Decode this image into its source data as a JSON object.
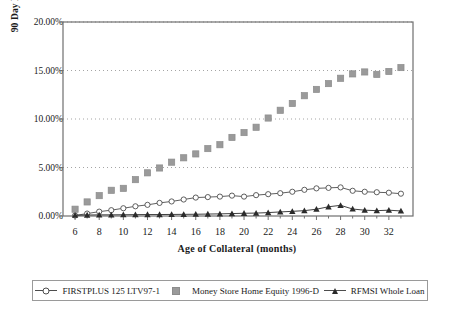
{
  "chart_data": {
    "type": "line",
    "title": "",
    "xlabel": "Age of Collateral (months)",
    "ylabel": "90 Day Delinquency",
    "ylabel_superscript": "1",
    "xlim": [
      5,
      34
    ],
    "ylim": [
      0,
      20
    ],
    "ytick_labels": [
      "0.00%",
      "5.00%",
      "10.00%",
      "15.00%",
      "20.00%"
    ],
    "ytick_values": [
      0,
      5,
      10,
      15,
      20
    ],
    "xtick_labels": [
      "6",
      "8",
      "10",
      "12",
      "14",
      "16",
      "18",
      "20",
      "22",
      "24",
      "26",
      "28",
      "30",
      "32"
    ],
    "xtick_values": [
      6,
      8,
      10,
      12,
      14,
      16,
      18,
      20,
      22,
      24,
      26,
      28,
      30,
      32
    ],
    "grid": "horizontal-dotted",
    "legend_position": "bottom",
    "x": [
      6,
      7,
      8,
      9,
      10,
      11,
      12,
      13,
      14,
      15,
      16,
      17,
      18,
      19,
      20,
      21,
      22,
      23,
      24,
      25,
      26,
      27,
      28,
      29,
      30,
      31,
      32,
      33
    ],
    "series": [
      {
        "name": "FIRSTPLUS 125 LTV97-1",
        "marker": "open-circle",
        "line": true,
        "color": "#4d4d4d",
        "values": [
          0.05,
          0.25,
          0.45,
          0.6,
          0.8,
          1.0,
          1.15,
          1.35,
          1.5,
          1.7,
          1.9,
          1.95,
          2.0,
          2.1,
          2.0,
          2.15,
          2.25,
          2.35,
          2.5,
          2.7,
          2.85,
          2.9,
          2.95,
          2.6,
          2.5,
          2.45,
          2.4,
          2.3
        ]
      },
      {
        "name": "Money Store Home Equity 1996-D",
        "marker": "filled-square",
        "line": false,
        "color": "#9a9a9a",
        "values": [
          0.7,
          1.45,
          2.1,
          2.65,
          2.85,
          3.75,
          4.45,
          4.95,
          5.55,
          6.0,
          6.4,
          6.95,
          7.35,
          8.1,
          8.6,
          9.15,
          10.1,
          10.9,
          11.6,
          12.4,
          13.05,
          13.65,
          14.2,
          14.65,
          14.85,
          14.6,
          14.9,
          15.3
        ]
      },
      {
        "name": "RFMSI Whole Loan",
        "marker": "filled-triangle",
        "line": true,
        "color": "#2b2b2b",
        "values": [
          0.08,
          0.1,
          0.12,
          0.12,
          0.13,
          0.14,
          0.15,
          0.15,
          0.16,
          0.17,
          0.18,
          0.2,
          0.22,
          0.25,
          0.28,
          0.3,
          0.35,
          0.42,
          0.48,
          0.55,
          0.7,
          0.95,
          1.1,
          0.72,
          0.6,
          0.55,
          0.6,
          0.52
        ]
      }
    ]
  },
  "legend": {
    "items": [
      {
        "label": "FIRSTPLUS 125 LTV97-1",
        "marker": "open-circle",
        "line": true
      },
      {
        "label": "Money Store Home Equity 1996-D",
        "marker": "filled-square",
        "line": false
      },
      {
        "label": "RFMSI Whole Loan",
        "marker": "filled-triangle",
        "line": true
      }
    ]
  }
}
